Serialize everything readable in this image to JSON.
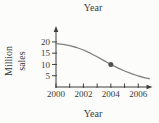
{
  "figure": {
    "background": "#fcfcfa"
  },
  "chart_data": {
    "type": "line",
    "title": "Year",
    "xlabel": "Year",
    "ylabel": "Million sales",
    "ylabel_lines": [
      "Million",
      "sales"
    ],
    "xlim": [
      2000,
      2007
    ],
    "ylim": [
      0,
      22
    ],
    "grid": false,
    "legend": null,
    "x_ticks_minor": [
      2000,
      2001,
      2002,
      2003,
      2004,
      2005,
      2006
    ],
    "x_tick_labels": [
      2000,
      2002,
      2004,
      2006
    ],
    "y_ticks": [
      5,
      10,
      15,
      20
    ],
    "series": [
      {
        "name": "million-sales",
        "x": [
          2000,
          2000.5,
          2001,
          2001.5,
          2002,
          2002.5,
          2003,
          2003.5,
          2004,
          2004.5,
          2005,
          2005.5,
          2006,
          2006.5,
          2006.8
        ],
        "y": [
          19.2,
          18.9,
          18.3,
          17.5,
          16.4,
          15.0,
          13.4,
          11.7,
          10.0,
          8.5,
          7.1,
          5.9,
          4.9,
          4.1,
          3.7
        ]
      }
    ],
    "highlight_point": {
      "x": 2004,
      "y": 10
    },
    "colors": {
      "curve": "#7f7f7f",
      "marker": "#544e4e",
      "axis": "#3f3f3f",
      "text": "#3a3a3a"
    }
  }
}
